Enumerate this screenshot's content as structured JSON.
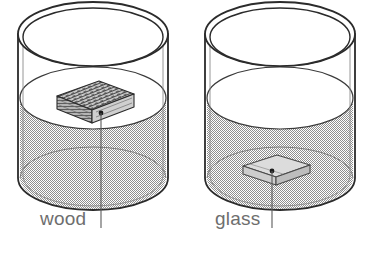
{
  "figure": {
    "background_color": "#ffffff",
    "outline_color": "#2b2b2b",
    "water_fill_color": "#b9b9b9",
    "label_color": "#6e6e6e",
    "leader_color": "#5a5a5a"
  },
  "cylinders": [
    {
      "id": "left-cylinder",
      "label": "wood",
      "label_position": {
        "x": 40,
        "y": 225
      },
      "leader": {
        "x": 101,
        "y_top": 113,
        "y_bottom": 228
      },
      "block": {
        "material": "wood",
        "state": "floating at water surface",
        "fill_color": "#d8d8d8",
        "top_face_color": "#9a9a9a"
      }
    },
    {
      "id": "right-cylinder",
      "label": "glass",
      "label_position": {
        "x": 215,
        "y": 225
      },
      "leader": {
        "x": 272,
        "y_top": 171,
        "y_bottom": 228
      },
      "block": {
        "material": "glass",
        "state": "resting on the bottom",
        "fill_color": "#e3e3e3",
        "top_face_color": "#c9c9c9"
      }
    }
  ],
  "labels": {
    "wood": "wood",
    "glass": "glass"
  }
}
